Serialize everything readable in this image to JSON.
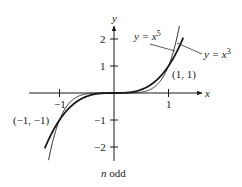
{
  "chart_data": {
    "type": "line",
    "title": "",
    "caption": "n odd",
    "xlabel": "x",
    "ylabel": "y",
    "xlim": [
      -1.55,
      1.6
    ],
    "ylim": [
      -2.5,
      2.5
    ],
    "grid": false,
    "x_ticks": [
      -1,
      1
    ],
    "x_tick_labels": [
      "−1",
      "1"
    ],
    "y_ticks": [
      -2,
      -1,
      1,
      2
    ],
    "y_tick_labels": [
      "−2",
      "−1",
      "1",
      "2"
    ],
    "series": [
      {
        "name": "y = x^5",
        "label_main": "y = x",
        "label_sup": "5",
        "function": "x^5",
        "x_range": [
          -1.2,
          1.2
        ],
        "stroke_width": 1.0,
        "color": "#333333"
      },
      {
        "name": "y = x^3",
        "label_main": "y = x",
        "label_sup": "3",
        "function": "x^3",
        "x_range": [
          -1.27,
          1.27
        ],
        "stroke_width": 1.8,
        "color": "#1a1a1a"
      }
    ],
    "annotations": [
      {
        "text": "(1, 1)",
        "x": 1,
        "y": 1
      },
      {
        "text": "(−1, −1)",
        "x": -1,
        "y": -1
      }
    ]
  }
}
